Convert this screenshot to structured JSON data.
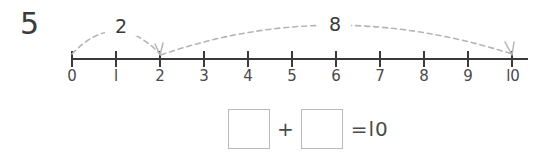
{
  "problem": {
    "number": "5"
  },
  "numberline": {
    "start": 0,
    "end": 10,
    "tick_labels": [
      "0",
      "l",
      "2",
      "3",
      "4",
      "5",
      "6",
      "7",
      "8",
      "9",
      "l0"
    ],
    "axis_color": "#3a3a3a",
    "arc_color": "#b5b5b5"
  },
  "jumps": [
    {
      "label": "2",
      "from": 0,
      "to": 2
    },
    {
      "label": "8",
      "from": 2,
      "to": 10
    }
  ],
  "equation": {
    "first_addend": "",
    "plus": "+",
    "second_addend": "",
    "result": "=l0"
  }
}
